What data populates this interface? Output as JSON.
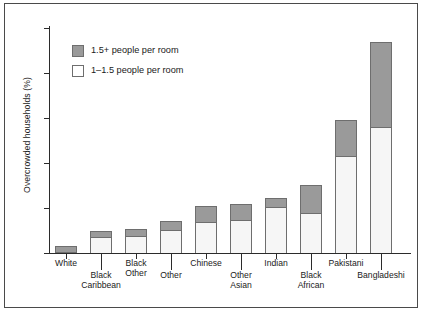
{
  "chart_data": {
    "type": "bar",
    "subtype": "stacked-bar",
    "title": "",
    "xlabel": "",
    "ylabel": "Overcrowded households (%)",
    "ylim": [
      0,
      50
    ],
    "yticks": [
      0,
      10,
      20,
      30,
      40,
      50
    ],
    "grid": false,
    "legend_position": "upper-left-inside",
    "categories": [
      "White",
      "Black Caribbean",
      "Black Other",
      "Other",
      "Chinese",
      "Other Asian",
      "Indian",
      "Black African",
      "Pakistani",
      "Bangladeshi"
    ],
    "series": [
      {
        "name": "1–1.5 people per room",
        "color": "#f6f6f6",
        "values": [
          0.3,
          3.5,
          3.7,
          5.2,
          7.0,
          7.4,
          10.3,
          9.0,
          21.5,
          28.0
        ]
      },
      {
        "name": "1.5+ people per room",
        "color": "#9a9a9a",
        "values": [
          1.2,
          1.3,
          1.6,
          2.0,
          3.4,
          3.5,
          2.0,
          6.2,
          8.0,
          19.0
        ]
      }
    ],
    "totals": [
      1.5,
      4.8,
      5.3,
      7.2,
      10.4,
      10.9,
      12.3,
      15.2,
      29.5,
      47.0
    ]
  },
  "axes": {
    "y_title": "Overcrowded households (%)",
    "y_tick_labels": [
      "50",
      "40",
      "30",
      "20",
      "10",
      "0"
    ]
  },
  "legend": {
    "items": [
      {
        "label": "1.5+ people per room",
        "swatch": "dark"
      },
      {
        "label": "1–1.5 people per room",
        "swatch": "light"
      }
    ]
  },
  "x_labels": [
    {
      "text": "White",
      "row": "top"
    },
    {
      "text": "Black",
      "row": "top2",
      "line1": "Black",
      "line2": "Caribbean"
    },
    {
      "text": "Black Other",
      "row": "top",
      "line1": "Black",
      "line2": "Other"
    },
    {
      "text": "Other",
      "row": "bot"
    },
    {
      "text": "Chinese",
      "row": "top"
    },
    {
      "text": "Other Asian",
      "row": "bot",
      "line1": "Other",
      "line2": "Asian"
    },
    {
      "text": "Indian",
      "row": "top"
    },
    {
      "text": "Black African",
      "row": "bot",
      "line1": "Black",
      "line2": "African"
    },
    {
      "text": "Pakistani",
      "row": "top"
    },
    {
      "text": "Bangladeshi",
      "row": "bot"
    }
  ],
  "tick_label_lines": {
    "white": "White",
    "black_caribbean_1": "Black",
    "black_caribbean_2": "Caribbean",
    "black_other_1": "Black",
    "black_other_2": "Other",
    "other": "Other",
    "chinese": "Chinese",
    "other_asian_1": "Other",
    "other_asian_2": "Asian",
    "indian": "Indian",
    "black_african_1": "Black",
    "black_african_2": "African",
    "pakistani": "Pakistani",
    "bangladeshi": "Bangladeshi"
  }
}
